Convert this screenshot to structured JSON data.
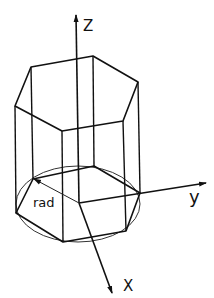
{
  "figure": {
    "axes": {
      "z_label": "Z",
      "y_label": "y",
      "x_label": "X"
    },
    "dimension_label": "rad",
    "colors": {
      "stroke": "#111111",
      "background": "#ffffff"
    }
  }
}
